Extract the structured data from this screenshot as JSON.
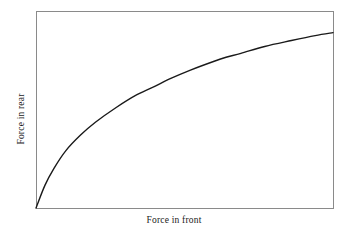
{
  "figure": {
    "background_color": "#ffffff",
    "frame_color": "#8a8a8a",
    "curve_color": "#1a1a1a"
  },
  "chart_data": {
    "type": "line",
    "title": "",
    "subtitle": "",
    "xlabel": "Force in front",
    "ylabel": "Force in rear",
    "grid": false,
    "legend": null,
    "xticks": [],
    "yticks": [],
    "xtick_labels": [],
    "ytick_labels": [],
    "xlim": [
      0,
      1
    ],
    "ylim": [
      0,
      1
    ],
    "annotations": [],
    "series": [
      {
        "name": "Force in rear vs force in front",
        "shape": "concave-increasing saturating curve from origin",
        "x": [
          0.0,
          0.03,
          0.06,
          0.1,
          0.15,
          0.2,
          0.27,
          0.34,
          0.41,
          0.45,
          0.52,
          0.6,
          0.64,
          0.69,
          0.77,
          0.86,
          0.94,
          1.0
        ],
        "y": [
          0.0,
          0.115,
          0.2,
          0.29,
          0.37,
          0.435,
          0.51,
          0.575,
          0.625,
          0.655,
          0.7,
          0.745,
          0.765,
          0.785,
          0.82,
          0.85,
          0.875,
          0.89
        ]
      }
    ]
  },
  "geometry": {
    "plot_left": 36,
    "plot_top": 11,
    "plot_right": 333,
    "plot_bottom": 208
  }
}
